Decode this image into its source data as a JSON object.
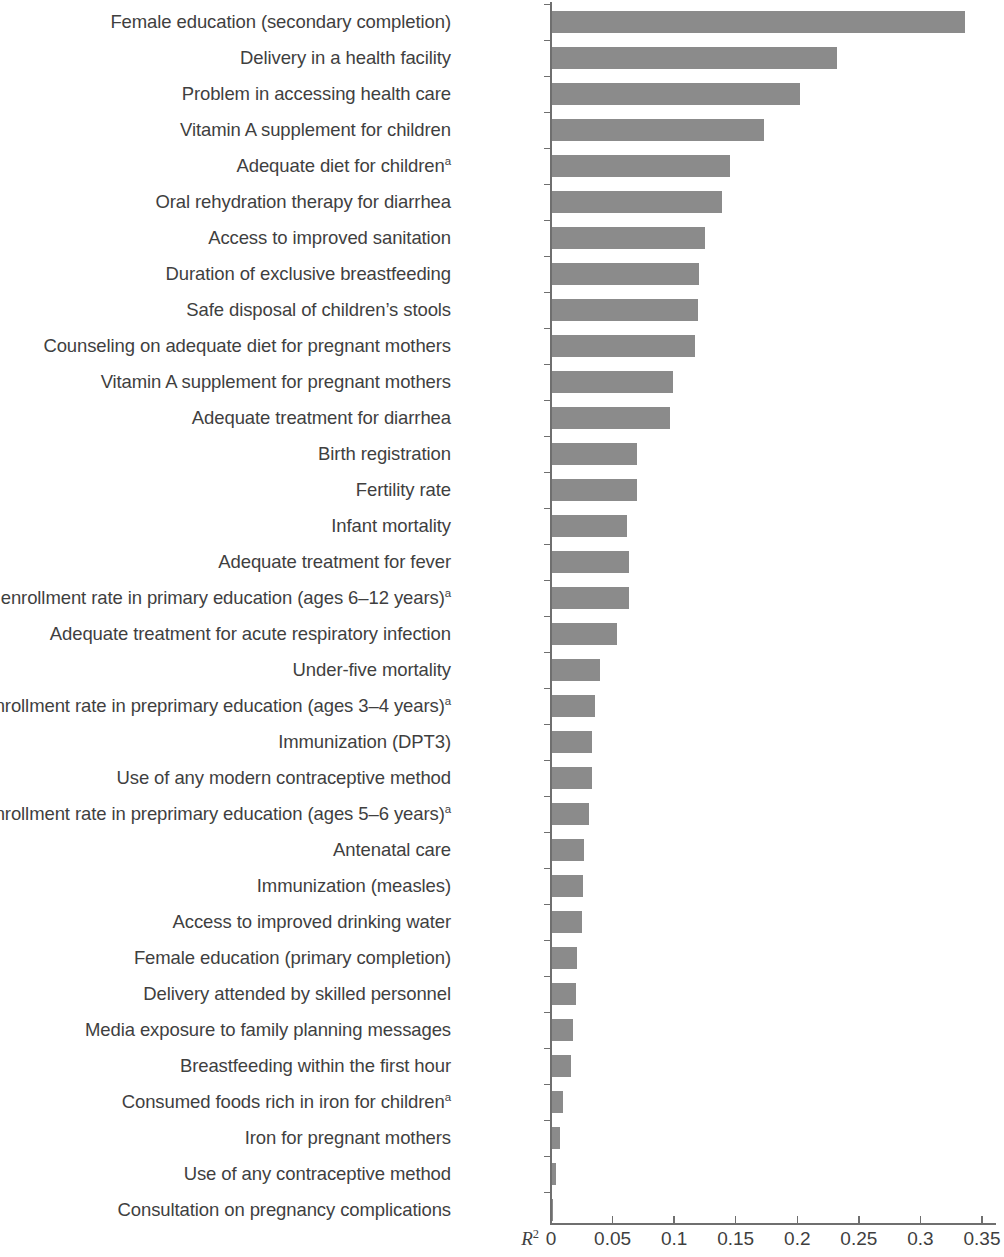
{
  "chart_data": {
    "type": "bar",
    "orientation": "horizontal",
    "title": "",
    "subtitle": "",
    "xlabel": "R2",
    "xlabel_display": "R",
    "xlabel_superscript": "2",
    "ylabel": "",
    "xlim": [
      0,
      0.35
    ],
    "grid": false,
    "legend": null,
    "bar_color": "#8b8b8b",
    "axis_color": "#6f6f6f",
    "text_color": "#3f3f3f",
    "xticks": [
      0,
      0.05,
      0.1,
      0.15,
      0.2,
      0.25,
      0.3,
      0.35
    ],
    "xticklabels": [
      "0",
      "0.05",
      "0.1",
      "0.15",
      "0.2",
      "0.25",
      "0.3",
      "0.35"
    ],
    "footnote_marker": "a",
    "categories": [
      "Female education (secondary completion)",
      "Delivery in a health facility",
      "Problem in accessing health care",
      "Vitamin A supplement for children",
      "Adequate diet for children",
      "Oral rehydration therapy for diarrhea",
      "Access to improved sanitation",
      "Duration of exclusive breastfeeding",
      "Safe disposal of children’s stools",
      "Counseling on adequate diet for pregnant mothers",
      "Vitamin A supplement for pregnant mothers",
      "Adequate treatment for diarrhea",
      "Birth registration",
      "Fertility rate",
      "Infant mortality",
      "Adequate treatment for fever",
      "Net enrollment rate in primary education (ages 6–12 years)",
      "Adequate treatment for acute respiratory infection",
      "Under-five mortality",
      "Net enrollment rate in preprimary education (ages 3–4 years)",
      "Immunization (DPT3)",
      "Use of any modern contraceptive method",
      "Net enrollment rate in preprimary education (ages 5–6 years)",
      "Antenatal care",
      "Immunization (measles)",
      "Access to improved drinking water",
      "Female education (primary completion)",
      "Delivery attended by skilled personnel",
      "Media exposure to family planning messages",
      "Breastfeeding within the first hour",
      "Consumed foods rich in iron for children",
      "Iron for pregnant mothers",
      "Use of any contraceptive method",
      "Consultation on pregnancy complications"
    ],
    "has_superscript": [
      false,
      false,
      false,
      false,
      true,
      false,
      false,
      false,
      false,
      false,
      false,
      false,
      false,
      false,
      false,
      false,
      true,
      false,
      false,
      true,
      false,
      false,
      true,
      false,
      false,
      false,
      false,
      false,
      false,
      false,
      true,
      false,
      false,
      false
    ],
    "values": [
      0.336,
      0.232,
      0.202,
      0.173,
      0.145,
      0.139,
      0.125,
      0.12,
      0.119,
      0.117,
      0.099,
      0.097,
      0.07,
      0.07,
      0.062,
      0.063,
      0.063,
      0.054,
      0.04,
      0.036,
      0.033,
      0.033,
      0.031,
      0.027,
      0.026,
      0.025,
      0.021,
      0.02,
      0.018,
      0.016,
      0.01,
      0.007,
      0.004,
      0.002
    ]
  }
}
